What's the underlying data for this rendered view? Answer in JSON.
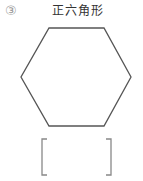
{
  "problem": {
    "number": "③",
    "title": "正六角形",
    "shape": "regular-hexagon",
    "answer_box": ""
  },
  "colors": {
    "outline": "#555555",
    "bracket": "#888888",
    "number": "#9a9a9a"
  }
}
